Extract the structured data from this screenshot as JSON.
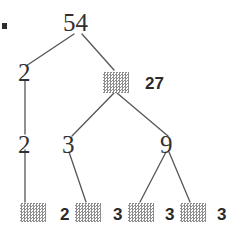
{
  "figure": {
    "type": "factor-tree",
    "bullet": "▪",
    "root": {
      "label": "54",
      "x": 63,
      "y": 10
    },
    "redaction_label": "hidden-factor-block",
    "nodes": [
      {
        "id": "root",
        "label": "54",
        "style": "serif",
        "x": 63,
        "y": 10,
        "redacted": false
      },
      {
        "id": "l1-left",
        "label": "2",
        "style": "serif",
        "x": 16,
        "y": 70,
        "redacted": false
      },
      {
        "id": "l1-right",
        "label": "27",
        "style": "bold",
        "x": 103,
        "y": 72,
        "redacted": true
      },
      {
        "id": "l2-left",
        "label": "2",
        "style": "serif",
        "x": 16,
        "y": 140,
        "redacted": false
      },
      {
        "id": "l2-mid",
        "label": "3",
        "style": "serif",
        "x": 62,
        "y": 140,
        "redacted": false
      },
      {
        "id": "l2-right",
        "label": "9",
        "style": "serif",
        "x": 160,
        "y": 140,
        "redacted": false
      },
      {
        "id": "leaf-1",
        "label": "2",
        "style": "bold",
        "x": 20,
        "y": 203,
        "redacted": true
      },
      {
        "id": "leaf-2",
        "label": "2",
        "style": "bold",
        "x": 75,
        "y": 203,
        "redacted": true
      },
      {
        "id": "leaf-3",
        "label": "3",
        "style": "bold",
        "x": 128,
        "y": 203,
        "redacted": true
      },
      {
        "id": "leaf-4",
        "label": "3",
        "style": "bold",
        "x": 180,
        "y": 203,
        "redacted": true
      }
    ],
    "leaf_row": [
      {
        "kind": "block",
        "label": "",
        "name": "leaf-block-1"
      },
      {
        "kind": "value",
        "label": "2",
        "name": "leaf-value-1"
      },
      {
        "kind": "block",
        "label": "",
        "name": "leaf-block-2"
      },
      {
        "kind": "value",
        "label": "3",
        "name": "leaf-value-2"
      },
      {
        "kind": "block",
        "label": "",
        "name": "leaf-block-3"
      },
      {
        "kind": "value",
        "label": "3",
        "name": "leaf-value-3"
      },
      {
        "kind": "block",
        "label": "",
        "name": "leaf-block-4"
      },
      {
        "kind": "value",
        "label": "3",
        "name": "leaf-value-4"
      }
    ],
    "labels": {
      "root": "54",
      "left_l1": "2",
      "right_l1": "27",
      "left_l2": "2",
      "mid_l2": "3",
      "right_l2": "9",
      "leaf_2": "2",
      "leaf_3a": "3",
      "leaf_3b": "3",
      "leaf_3c": "3"
    },
    "colors": {
      "ink": "#33302f",
      "edge": "#55555a",
      "block": "#8d8d8d",
      "background": "#ffffff"
    }
  }
}
